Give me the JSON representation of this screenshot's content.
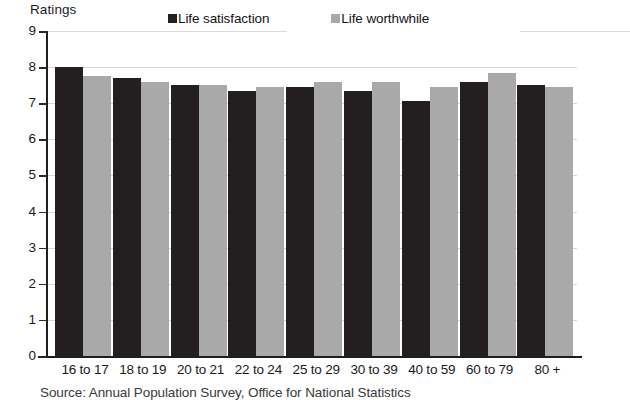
{
  "chart_data": {
    "type": "bar",
    "title": "",
    "ylabel": "Ratings",
    "xlabel": "",
    "ylim": [
      0,
      9
    ],
    "yticks": [
      0,
      1,
      2,
      3,
      4,
      5,
      6,
      7,
      8,
      9
    ],
    "grid": true,
    "legend_position": "top",
    "categories": [
      "16 to 17",
      "18 to 19",
      "20 to 21",
      "22 to 24",
      "25 to 29",
      "30 to 39",
      "40 to 59",
      "60 to 79",
      "80 +"
    ],
    "series": [
      {
        "name": "Life satisfaction",
        "color": "#231f20",
        "values": [
          8.0,
          7.7,
          7.5,
          7.35,
          7.45,
          7.35,
          7.05,
          7.6,
          7.5
        ]
      },
      {
        "name": "Life worthwhile",
        "color": "#a9a9a9",
        "values": [
          7.75,
          7.6,
          7.5,
          7.45,
          7.6,
          7.6,
          7.45,
          7.85,
          7.45
        ]
      }
    ],
    "source": "Source: Annual Population Survey, Office for National Statistics"
  },
  "legend": {
    "items": [
      {
        "label": "Life satisfaction",
        "swatch": "dark"
      },
      {
        "label": "Life worthwhile",
        "swatch": "light"
      }
    ]
  },
  "axis": {
    "y_title": "Ratings"
  }
}
